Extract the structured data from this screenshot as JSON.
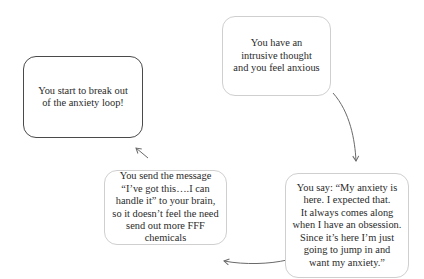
{
  "diagram": {
    "type": "cycle",
    "nodes": [
      {
        "id": "intrusive",
        "text": "You have an\nintrusive thought\nand you feel anxious"
      },
      {
        "id": "say",
        "text": "You say: “My anxiety is\nhere. I expected that.\nIt always comes along\nwhen I have an obsession.\nSince it’s here I’m just\ngoing to jump in and\nwant my anxiety.”"
      },
      {
        "id": "send",
        "text": "You send the message\n“I’ve got this….I can\nhandle it”  to your brain,\nso it doesn’t feel the need\nsend out more FFF chemicals"
      },
      {
        "id": "break",
        "text": "You start to break out\nof the anxiety loop!"
      }
    ],
    "edges": [
      {
        "from": "intrusive",
        "to": "say"
      },
      {
        "from": "say",
        "to": "send"
      },
      {
        "from": "send",
        "to": "break"
      }
    ],
    "colors": {
      "soft_border": "#cfcfcf",
      "strong_border": "#4a4a4a",
      "arrow": "#6a6a6a",
      "text": "#2a2a2a"
    }
  }
}
